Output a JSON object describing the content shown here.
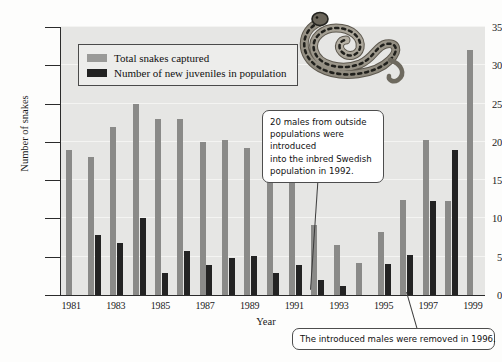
{
  "chart_data": {
    "type": "bar",
    "title": "",
    "xlabel": "Year",
    "ylabel": "Number of snakes",
    "ylim": [
      0,
      35
    ],
    "ytick_step": 5,
    "yticks": [
      0,
      5,
      10,
      15,
      20,
      25,
      30,
      35
    ],
    "grid": true,
    "legend_position": "top-left-inside",
    "categories": [
      1981,
      1982,
      1983,
      1984,
      1985,
      1986,
      1987,
      1988,
      1989,
      1990,
      1991,
      1992,
      1993,
      1994,
      1995,
      1996,
      1997,
      1998,
      1999
    ],
    "xtick_labels": [
      "1981",
      "1983",
      "1985",
      "1987",
      "1989",
      "1991",
      "1993",
      "1995",
      "1997",
      "1999"
    ],
    "series": [
      {
        "name": "Total snakes captured",
        "color": "#8a8a88",
        "values": [
          19,
          18,
          22,
          25,
          23,
          23,
          20,
          20.2,
          19.2,
          17,
          15,
          9.2,
          6.5,
          4.2,
          8.2,
          12.4,
          20.3,
          12.3,
          32
        ]
      },
      {
        "name": "Number of new juveniles in population",
        "color": "#232323",
        "values": [
          0,
          7.8,
          6.8,
          10,
          2.9,
          5.8,
          3.9,
          4.8,
          5.1,
          2.9,
          3.9,
          1.9,
          1.2,
          0,
          4,
          5.2,
          12.3,
          19,
          0
        ]
      }
    ],
    "annotations": [
      {
        "id": "introduced",
        "text": "20 males from outside populations were introduced into the inbred Swedish population in 1992.",
        "target_year": 1992
      },
      {
        "id": "removed",
        "text": "The introduced males were removed in 1996.",
        "target_year": 1996
      }
    ]
  },
  "legend": {
    "items": [
      {
        "label": "Total snakes captured",
        "swatch": "total"
      },
      {
        "label": "Number of new juveniles in population",
        "swatch": "juvenile"
      }
    ]
  },
  "axes": {
    "y_title": "Number of snakes",
    "x_title": "Year"
  },
  "callouts": {
    "introduced_line1": "20 males from outside",
    "introduced_line2": "populations were introduced",
    "introduced_line3": "into the inbred Swedish",
    "introduced_line4": "population in 1992.",
    "removed": "The introduced males were removed in 1996."
  },
  "illustration": {
    "name": "coiled-adder-snake"
  },
  "colors": {
    "total_bar": "#8a8a88",
    "juvenile_bar": "#232323",
    "plot_background": "#e6e6e4",
    "axis": "#2b2b2b"
  }
}
